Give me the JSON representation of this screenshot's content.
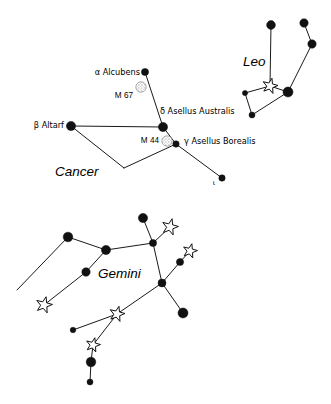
{
  "figure": {
    "width": 331,
    "height": 404,
    "background": "#ffffff",
    "line_color": "#1a1a1a",
    "star_fill": "#111111",
    "open_star_fill": "#ffffff",
    "cluster_color": "#b8b8b8"
  },
  "chart_data": {
    "type": "scatter",
    "xlabel": "",
    "ylabel": "",
    "grid": false,
    "legend": null,
    "constellations": [
      {
        "name": "Cancer",
        "label": {
          "text": "Cancer",
          "x": 55,
          "y": 172
        },
        "stars": [
          {
            "designation": "alpha",
            "name": "Alcubens",
            "label": "α Alcubens",
            "x": 145,
            "y": 72,
            "r": 3.6,
            "type": "filled",
            "label_x": 140,
            "label_y": 72,
            "label_anchor": "end"
          },
          {
            "designation": "beta",
            "name": "Altarf",
            "label": "β Altarf",
            "x": 71,
            "y": 126,
            "r": 4.6,
            "type": "filled",
            "label_x": 64,
            "label_y": 125,
            "label_anchor": "end"
          },
          {
            "designation": "delta",
            "name": "Asellus Australis",
            "label": "δ Asellus Australis",
            "x": 163,
            "y": 127,
            "r": 4.6,
            "type": "filled",
            "label_x": 160,
            "label_y": 111,
            "label_anchor": "start"
          },
          {
            "designation": "gamma",
            "name": "Asellus Borealis",
            "label": "γ Asellus Borealis",
            "x": 176,
            "y": 144,
            "r": 3.2,
            "type": "filled",
            "label_x": 184,
            "label_y": 141,
            "label_anchor": "start"
          },
          {
            "designation": "iota",
            "name": "",
            "label": "ι",
            "x": 222,
            "y": 178,
            "r": 3.2,
            "type": "filled",
            "label_x": 214,
            "label_y": 183,
            "label_anchor": "middle"
          }
        ],
        "clusters": [
          {
            "name": "M 67",
            "label": "M 67",
            "x": 141,
            "y": 87,
            "r": 5.2,
            "label_x": 133,
            "label_y": 96,
            "label_anchor": "end"
          },
          {
            "name": "M 44",
            "label": "M 44",
            "x": 167,
            "y": 141,
            "r": 5.2,
            "label_x": 159,
            "label_y": 141,
            "label_anchor": "end"
          }
        ],
        "lines": [
          [
            [
              145,
              72
            ],
            [
              163,
              127
            ]
          ],
          [
            [
              71,
              126
            ],
            [
              163,
              127
            ]
          ],
          [
            [
              71,
              126
            ],
            [
              124,
              168
            ]
          ],
          [
            [
              124,
              168
            ],
            [
              176,
              144
            ]
          ],
          [
            [
              163,
              127
            ],
            [
              176,
              144
            ]
          ],
          [
            [
              176,
              144
            ],
            [
              222,
              178
            ]
          ]
        ]
      },
      {
        "name": "Leo",
        "label": {
          "text": "Leo",
          "x": 243,
          "y": 62
        },
        "stars": [
          {
            "designation": "",
            "name": "",
            "label": "",
            "x": 271,
            "y": 25,
            "r": 4.4,
            "type": "filled"
          },
          {
            "designation": "",
            "name": "",
            "label": "",
            "x": 304,
            "y": 23,
            "r": 4.2,
            "type": "filled"
          },
          {
            "designation": "",
            "name": "",
            "label": "",
            "x": 312,
            "y": 44,
            "r": 4.2,
            "type": "filled"
          },
          {
            "designation": "",
            "name": "",
            "label": "",
            "x": 288,
            "y": 92,
            "r": 5.0,
            "type": "filled"
          },
          {
            "designation": "",
            "name": "",
            "label": "",
            "x": 245,
            "y": 93,
            "r": 2.6,
            "type": "filled"
          },
          {
            "designation": "",
            "name": "",
            "label": "",
            "x": 252,
            "y": 115,
            "r": 3.0,
            "type": "filled"
          },
          {
            "designation": "Regulus",
            "name": "Regulus",
            "label": "",
            "x": 270,
            "y": 86,
            "r": 8.0,
            "type": "open"
          }
        ],
        "clusters": [],
        "lines": [
          [
            [
              271,
              25
            ],
            [
              270,
              86
            ]
          ],
          [
            [
              304,
              23
            ],
            [
              312,
              44
            ]
          ],
          [
            [
              312,
              44
            ],
            [
              288,
              92
            ]
          ],
          [
            [
              288,
              92
            ],
            [
              270,
              86
            ]
          ],
          [
            [
              270,
              86
            ],
            [
              245,
              93
            ]
          ],
          [
            [
              245,
              93
            ],
            [
              252,
              115
            ]
          ],
          [
            [
              252,
              115
            ],
            [
              288,
              92
            ]
          ]
        ]
      },
      {
        "name": "Gemini",
        "label": {
          "text": "Gemini",
          "x": 98,
          "y": 274
        },
        "stars": [
          {
            "designation": "",
            "name": "",
            "label": "",
            "x": 143,
            "y": 218,
            "r": 4.6,
            "type": "filled"
          },
          {
            "designation": "",
            "name": "",
            "label": "",
            "x": 153,
            "y": 243,
            "r": 3.6,
            "type": "filled"
          },
          {
            "designation": "",
            "name": "",
            "label": "",
            "x": 68,
            "y": 237,
            "r": 4.8,
            "type": "filled"
          },
          {
            "designation": "",
            "name": "",
            "label": "",
            "x": 106,
            "y": 250,
            "r": 4.6,
            "type": "filled"
          },
          {
            "designation": "",
            "name": "",
            "label": "",
            "x": 86,
            "y": 272,
            "r": 4.2,
            "type": "filled"
          },
          {
            "designation": "",
            "name": "",
            "label": "",
            "x": 162,
            "y": 283,
            "r": 4.0,
            "type": "filled"
          },
          {
            "designation": "",
            "name": "",
            "label": "",
            "x": 180,
            "y": 262,
            "r": 3.6,
            "type": "filled"
          },
          {
            "designation": "",
            "name": "",
            "label": "",
            "x": 183,
            "y": 313,
            "r": 5.0,
            "type": "filled"
          },
          {
            "designation": "",
            "name": "",
            "label": "",
            "x": 73,
            "y": 330,
            "r": 2.8,
            "type": "filled"
          },
          {
            "designation": "",
            "name": "",
            "label": "",
            "x": 91,
            "y": 362,
            "r": 4.8,
            "type": "filled"
          },
          {
            "designation": "",
            "name": "",
            "label": "",
            "x": 90,
            "y": 382,
            "r": 3.0,
            "type": "filled"
          },
          {
            "designation": "Castor",
            "name": "Castor",
            "label": "",
            "x": 170,
            "y": 227,
            "r": 8.5,
            "type": "open"
          },
          {
            "designation": "Pollux",
            "name": "Pollux",
            "label": "",
            "x": 190,
            "y": 251,
            "r": 7.5,
            "type": "open"
          },
          {
            "designation": "",
            "name": "",
            "label": "",
            "x": 44,
            "y": 305,
            "r": 8.5,
            "type": "open"
          },
          {
            "designation": "",
            "name": "",
            "label": "",
            "x": 117,
            "y": 314,
            "r": 8.0,
            "type": "open"
          },
          {
            "designation": "",
            "name": "",
            "label": "",
            "x": 93,
            "y": 345,
            "r": 7.5,
            "type": "open"
          }
        ],
        "clusters": [],
        "lines": [
          [
            [
              143,
              218
            ],
            [
              153,
              243
            ]
          ],
          [
            [
              153,
              243
            ],
            [
              170,
              227
            ]
          ],
          [
            [
              153,
              243
            ],
            [
              106,
              250
            ]
          ],
          [
            [
              153,
              243
            ],
            [
              162,
              283
            ]
          ],
          [
            [
              106,
              250
            ],
            [
              68,
              237
            ]
          ],
          [
            [
              68,
              237
            ],
            [
              17,
              290
            ]
          ],
          [
            [
              106,
              250
            ],
            [
              86,
              272
            ]
          ],
          [
            [
              86,
              272
            ],
            [
              44,
              305
            ]
          ],
          [
            [
              162,
              283
            ],
            [
              180,
              262
            ]
          ],
          [
            [
              180,
              262
            ],
            [
              190,
              251
            ]
          ],
          [
            [
              162,
              283
            ],
            [
              183,
              313
            ]
          ],
          [
            [
              162,
              283
            ],
            [
              117,
              314
            ]
          ],
          [
            [
              117,
              314
            ],
            [
              73,
              330
            ]
          ],
          [
            [
              117,
              314
            ],
            [
              93,
              345
            ]
          ],
          [
            [
              93,
              345
            ],
            [
              91,
              362
            ]
          ],
          [
            [
              91,
              362
            ],
            [
              90,
              382
            ]
          ]
        ]
      }
    ]
  }
}
